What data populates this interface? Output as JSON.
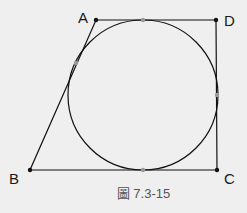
{
  "figure": {
    "caption": "圖 7.3-15",
    "labels": {
      "A": "A",
      "B": "B",
      "C": "C",
      "D": "D"
    },
    "points": {
      "A": [
        96,
        20
      ],
      "B": [
        30,
        170
      ],
      "C": [
        217,
        170
      ],
      "D": [
        216,
        20
      ]
    },
    "circle": {
      "cx": 143,
      "cy": 95,
      "r": 75
    },
    "tangent_points": [
      [
        143,
        20
      ],
      [
        217,
        95
      ],
      [
        143,
        170
      ],
      [
        76,
        63
      ]
    ],
    "colors": {
      "stroke": "#111111",
      "tangent": "#9a9a9a",
      "background": "#efefef"
    }
  }
}
